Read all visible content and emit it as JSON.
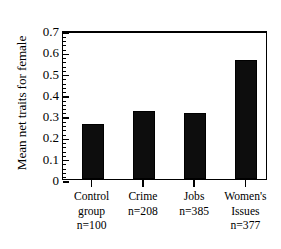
{
  "chart_data": {
    "type": "bar",
    "title": "",
    "xlabel": "",
    "ylabel": "Mean net traits for female",
    "categories": [
      "Control group",
      "Crime",
      "Jobs",
      "Women's Issues"
    ],
    "category_lines": [
      [
        "Control",
        "group",
        "n=100"
      ],
      [
        "Crime",
        "n=208"
      ],
      [
        "Jobs",
        "n=385"
      ],
      [
        "Women's",
        "Issues",
        "n=377"
      ]
    ],
    "sample_sizes": [
      "n=100",
      "n=208",
      "n=385",
      "n=377"
    ],
    "values": [
      0.26,
      0.32,
      0.31,
      0.56
    ],
    "ylim": [
      0,
      0.7
    ],
    "ytick_labels": [
      "0",
      "0.1",
      "0.2",
      "0.3",
      "0.4",
      "0.5",
      "0.6",
      "0.7"
    ],
    "ytick_values": [
      0,
      0.1,
      0.2,
      0.3,
      0.4,
      0.5,
      0.6,
      0.7
    ],
    "minor_tick_step": 0.02,
    "grid": false,
    "legend": null,
    "bar_color": "#0d0d0d",
    "axis_color": "#000000",
    "background_color": "#ffffff"
  }
}
